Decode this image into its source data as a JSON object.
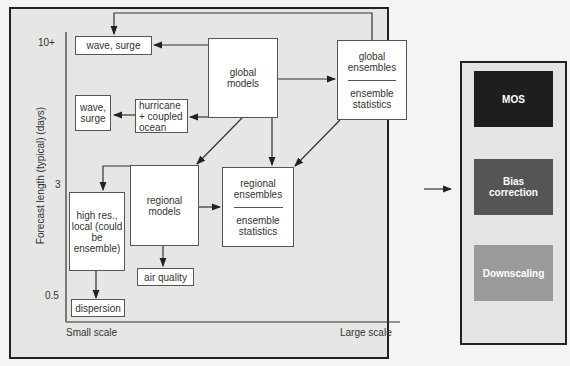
{
  "diagram": {
    "y_axis": {
      "label": "Forecast length (typical) (days)",
      "ticks": [
        "10+",
        "3",
        "0.5"
      ]
    },
    "x_axis": {
      "left_label": "Small scale",
      "right_label": "Large scale"
    },
    "nodes": {
      "wave_surge_top": "wave, surge",
      "global_models": "global models",
      "global_ensembles": {
        "top": "global ensembles",
        "bottom": "ensemble statistics"
      },
      "wave_surge_small": "wave, surge",
      "hurricane": "hurricane + coupled ocean",
      "regional_models": "regional models",
      "regional_ensembles": {
        "top": "regional ensembles",
        "bottom": "ensemble statistics"
      },
      "high_res": "high res., local (could be ensemble)",
      "air_quality": "air quality",
      "dispersion": "dispersion"
    },
    "post_processing": [
      {
        "label": "MOS",
        "color": "#1e1e1e"
      },
      {
        "label": "Bias correction",
        "color": "#555555"
      },
      {
        "label": "Downscaling",
        "color": "#9a9a9a"
      }
    ]
  }
}
